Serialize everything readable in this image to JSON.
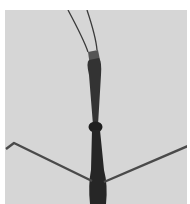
{
  "image": {
    "subject": "stick insect (walking stick) viewed from above",
    "style": "grayscale photograph",
    "colors": {
      "background": "#d6d6d6",
      "page": "#ffffff",
      "body": "#2a2a2a",
      "legs": "#4a4a4a"
    }
  }
}
